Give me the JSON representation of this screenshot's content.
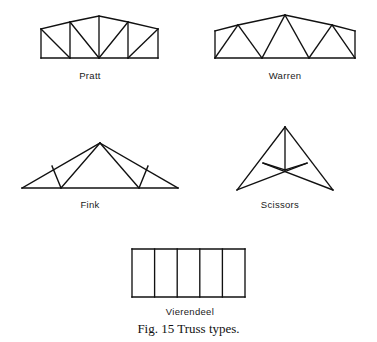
{
  "figure": {
    "caption": "Fig. 15  Truss types.",
    "background_color": "#ffffff",
    "line_color": "#111111"
  },
  "trusses": [
    {
      "id": "pratt",
      "label": "Pratt",
      "description": "Polygonal top chord, straight bottom chord, vertical posts with diagonals sloping toward the center.",
      "bays": 5,
      "verticals": 4,
      "diagonals": 4
    },
    {
      "id": "warren",
      "label": "Warren",
      "description": "Polygonal top chord, straight bottom chord, alternating diagonals forming a zigzag of triangles with no verticals.",
      "bays": 6,
      "verticals": 0,
      "diagonals": 6
    },
    {
      "id": "fink",
      "label": "Fink",
      "description": "Triangular profile with web members radiating from the apex and short struts normal to each rafter.",
      "bays": 4,
      "verticals": 0,
      "diagonals": 6
    },
    {
      "id": "scissors",
      "label": "Scissors",
      "description": "Steep rafters with a central vertical and crossing tie members producing a scissor action.",
      "bays": 2,
      "verticals": 1,
      "diagonals": 4
    },
    {
      "id": "vierendeel",
      "label": "Vierendeel",
      "description": "Rectangular frame with vertical posts only and no diagonal web members; rigid joints carry the load.",
      "bays": 5,
      "verticals": 4,
      "diagonals": 0
    }
  ]
}
